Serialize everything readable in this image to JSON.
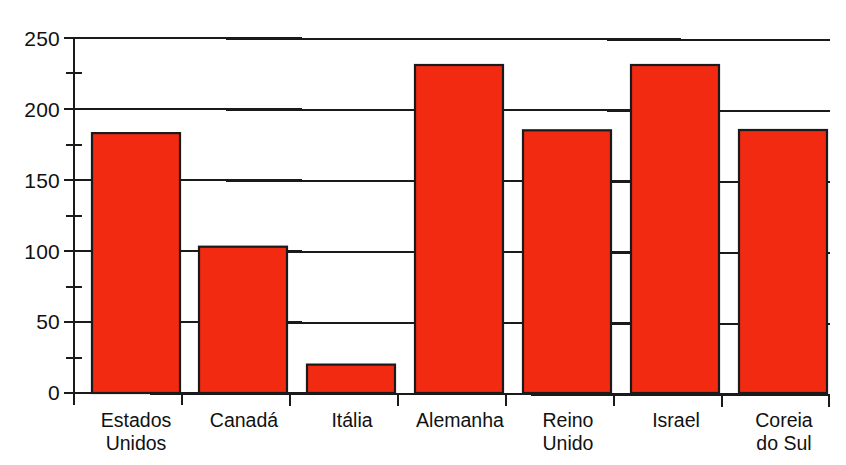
{
  "chart_data": {
    "type": "bar",
    "title": "",
    "subtitle": "",
    "xlabel": "",
    "ylabel": "",
    "categories": [
      "Estados\nUnidos",
      "Canadá",
      "Itália",
      "Alemanha",
      "Reino\nUnido",
      "Israel",
      "Coreia\ndo Sul"
    ],
    "values": [
      57,
      41,
      183,
      103,
      20,
      231,
      185
    ],
    "ylim": [
      0,
      250
    ],
    "yticks": [
      "0",
      "50",
      "100",
      "150",
      "200",
      "250"
    ],
    "ytick_values": [
      0,
      50,
      100,
      150,
      200,
      250
    ],
    "minor_tick_step": 25,
    "grid": "horizontal",
    "legend": "none",
    "bar_color": "#F22A12",
    "bar_edge_color": "#1a1a1a",
    "axis_color": "#1a1a1a",
    "background_color": "#FFFFFF"
  }
}
